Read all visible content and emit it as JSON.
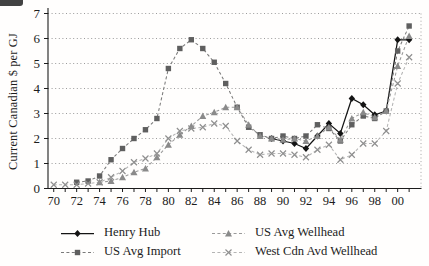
{
  "chart_data": {
    "type": "line",
    "x": [
      1970,
      1971,
      1972,
      1973,
      1974,
      1975,
      1976,
      1977,
      1978,
      1979,
      1980,
      1981,
      1982,
      1983,
      1984,
      1985,
      1986,
      1987,
      1988,
      1989,
      1990,
      1991,
      1992,
      1993,
      1994,
      1995,
      1996,
      1997,
      1998,
      1999,
      2000,
      2001
    ],
    "xtick_labels": [
      "70",
      "72",
      "74",
      "76",
      "78",
      "80",
      "82",
      "84",
      "86",
      "88",
      "90",
      "92",
      "94",
      "96",
      "98",
      "00"
    ],
    "yticks": [
      0,
      1,
      2,
      3,
      4,
      5,
      6,
      7
    ],
    "ylim": [
      0,
      7
    ],
    "ylabel": "Current Canadian $ per GJ",
    "xlabel": "",
    "title": "",
    "grid": "horizontal-dotted",
    "legend_position": "bottom",
    "series": [
      {
        "name": "Henry Hub",
        "marker": "diamond",
        "line": "solid",
        "color": "#141414",
        "marker_color": "#141414",
        "values": [
          null,
          null,
          null,
          null,
          null,
          null,
          null,
          null,
          null,
          null,
          null,
          null,
          null,
          null,
          null,
          null,
          null,
          null,
          null,
          2.0,
          1.9,
          1.8,
          1.6,
          2.1,
          2.6,
          2.2,
          3.6,
          3.35,
          2.95,
          3.1,
          5.95,
          5.95
        ]
      },
      {
        "name": "US Avg Import",
        "marker": "square",
        "line": "dashed",
        "color": "#7a7a7a",
        "marker_color": "#5f5f5f",
        "values": [
          null,
          null,
          0.25,
          0.3,
          0.5,
          1.15,
          1.6,
          2.0,
          2.35,
          2.8,
          4.8,
          5.6,
          5.95,
          5.6,
          5.05,
          4.2,
          3.25,
          2.45,
          2.15,
          2.0,
          2.1,
          2.0,
          2.1,
          2.55,
          2.4,
          1.9,
          2.55,
          2.9,
          2.8,
          3.1,
          5.5,
          6.5
        ]
      },
      {
        "name": "US Avg Wellhead",
        "marker": "triangle",
        "line": "dashed",
        "color": "#9a9a9a",
        "marker_color": "#8a8a8a",
        "values": [
          null,
          null,
          null,
          null,
          0.25,
          0.3,
          0.45,
          0.65,
          0.8,
          1.25,
          1.75,
          2.15,
          2.5,
          2.9,
          3.05,
          3.25,
          3.25,
          2.55,
          2.1,
          2.0,
          1.95,
          2.0,
          1.9,
          2.1,
          2.45,
          1.95,
          2.8,
          3.05,
          2.85,
          3.1,
          4.9,
          6.1
        ]
      },
      {
        "name": "West Cdn Avd Wellhead",
        "marker": "x",
        "line": "dashed",
        "color": "#b4b4b4",
        "marker_color": "#8f8f8f",
        "values": [
          0.15,
          0.15,
          0.15,
          0.2,
          0.25,
          0.45,
          0.7,
          1.05,
          1.2,
          1.4,
          2.0,
          2.3,
          2.4,
          2.45,
          2.6,
          2.5,
          1.9,
          1.55,
          1.35,
          1.4,
          1.4,
          1.35,
          1.25,
          1.55,
          1.75,
          1.15,
          1.35,
          1.8,
          1.8,
          2.3,
          4.2,
          5.25
        ]
      }
    ]
  }
}
